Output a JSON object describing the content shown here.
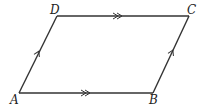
{
  "diagram": {
    "type": "parallelogram",
    "vertices": [
      {
        "name": "A",
        "x": 19,
        "y": 93,
        "label_x": 10,
        "label_y": 104
      },
      {
        "name": "B",
        "x": 153,
        "y": 93,
        "label_x": 149,
        "label_y": 104
      },
      {
        "name": "C",
        "x": 189,
        "y": 16,
        "label_x": 187,
        "label_y": 14
      },
      {
        "name": "D",
        "x": 57,
        "y": 16,
        "label_x": 50,
        "label_y": 14
      }
    ],
    "edges": [
      {
        "from": "A",
        "to": "B",
        "marker": "double-arrow"
      },
      {
        "from": "D",
        "to": "C",
        "marker": "double-arrow"
      },
      {
        "from": "A",
        "to": "D",
        "marker": "single-arrow"
      },
      {
        "from": "B",
        "to": "C",
        "marker": "single-arrow"
      }
    ],
    "labels": {
      "A": "A",
      "B": "B",
      "C": "C",
      "D": "D"
    },
    "colors": {
      "stroke": "#333333",
      "background": "#ffffff"
    }
  }
}
